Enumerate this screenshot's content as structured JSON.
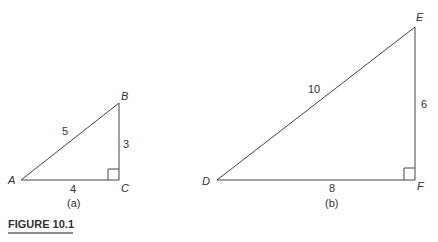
{
  "figure": {
    "title": "FIGURE 10.1",
    "accent_color": "#555555"
  },
  "triangles": [
    {
      "caption": "(a)",
      "vertices": {
        "A": "A",
        "B": "B",
        "C": "C"
      },
      "sides": {
        "hypotenuse": "5",
        "vertical": "3",
        "base": "4"
      },
      "right_angle_at": "C"
    },
    {
      "caption": "(b)",
      "vertices": {
        "D": "D",
        "E": "E",
        "F": "F"
      },
      "sides": {
        "hypotenuse": "10",
        "vertical": "6",
        "base": "8"
      },
      "right_angle_at": "F"
    }
  ]
}
